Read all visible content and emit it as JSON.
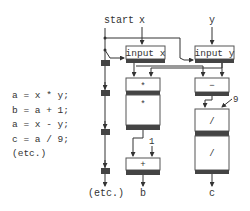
{
  "code": {
    "lines": [
      "a = x * y;",
      "b = a + 1;",
      "a = x - y;",
      "c = a / 9;",
      "(etc.)"
    ]
  },
  "labels": {
    "start": "start",
    "x": "x",
    "y": "y",
    "etc": "(etc.)",
    "b": "b",
    "c": "c",
    "const_1": "1",
    "const_9": "9"
  },
  "nodes": {
    "input_x": "input x",
    "input_y": "input y",
    "mul_1": "*",
    "mul_2": "*",
    "sub": "−",
    "add": "+",
    "div_1": "/",
    "div_2": "/"
  },
  "colors": {
    "line": "#333333",
    "bar": "#444444",
    "box_border": "#555555",
    "text": "#333333"
  }
}
